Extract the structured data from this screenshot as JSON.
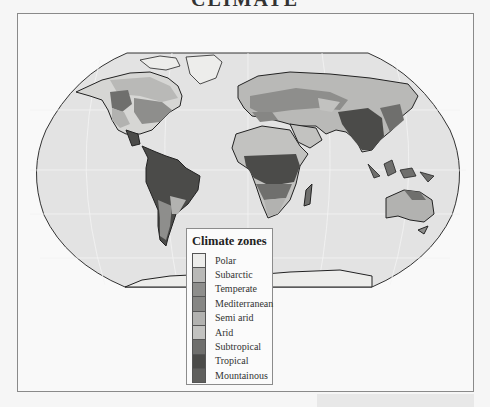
{
  "title": "CLIMATE",
  "legend": {
    "title": "Climate zones",
    "items": [
      {
        "label": "Polar",
        "color": "#ededeb"
      },
      {
        "label": "Subarctic",
        "color": "#b9b9b7"
      },
      {
        "label": "Temperate",
        "color": "#8e8e8c"
      },
      {
        "label": "Mediterranean",
        "color": "#868684"
      },
      {
        "label": "Semi arid",
        "color": "#b2b2b0"
      },
      {
        "label": "Arid",
        "color": "#c2c2c0"
      },
      {
        "label": "Subtropical",
        "color": "#6f6f6d"
      },
      {
        "label": "Tropical",
        "color": "#4b4b49"
      },
      {
        "label": "Mountainous",
        "color": "#5f5f5d"
      }
    ]
  },
  "colors": {
    "ocean": "#e3e3e3",
    "coast": "#2a2a2a",
    "frame_border": "#8a8a8a"
  }
}
